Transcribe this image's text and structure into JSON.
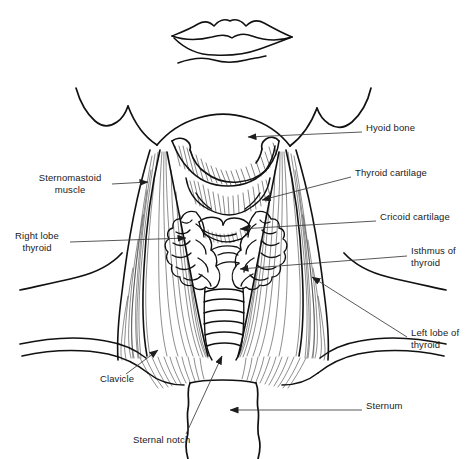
{
  "figure": {
    "type": "anatomical-line-drawing",
    "background_color": "#ffffff",
    "ink_color": "#000000",
    "leader_color": "#3a3a3a",
    "width": 466,
    "height": 459
  },
  "labels": {
    "hyoid_bone": "Hyoid bone",
    "thyroid_cartilage": "Thyroid cartilage",
    "cricoid_cartilage": "Cricoid cartilage",
    "isthmus_of_thyroid": "Isthmus of\nthyroid",
    "left_lobe_of_thyroid": "Left lobe of\nthyroid",
    "sternum": "Sternum",
    "sternomastoid_muscle": "Sternomastoid\nmuscle",
    "right_lobe_thyroid": "Right lobe\nthyroid",
    "clavicle": "Clavicle",
    "sternal_notch": "Sternal notch"
  },
  "label_positions": {
    "hyoid_bone": {
      "x": 366,
      "y": 128,
      "side": "right"
    },
    "thyroid_cartilage": {
      "x": 355,
      "y": 173,
      "side": "right"
    },
    "cricoid_cartilage": {
      "x": 380,
      "y": 217,
      "side": "right"
    },
    "isthmus_of_thyroid": {
      "x": 411,
      "y": 251,
      "side": "right"
    },
    "left_lobe_of_thyroid": {
      "x": 411,
      "y": 333,
      "side": "right"
    },
    "sternum": {
      "x": 366,
      "y": 406,
      "side": "right"
    },
    "sternomastoid_muscle": {
      "x": 34,
      "y": 178,
      "side": "left"
    },
    "right_lobe_thyroid": {
      "x": 10,
      "y": 236,
      "side": "left"
    },
    "clavicle": {
      "x": 100,
      "y": 379,
      "side": "left"
    },
    "sternal_notch": {
      "x": 133,
      "y": 440,
      "side": "center"
    }
  },
  "structures": [
    {
      "name": "lips",
      "note": "Upper and lower lip outline at top of figure"
    },
    {
      "name": "chin-and-jaw",
      "note": "Chin underside with mandible border and ear lobes"
    },
    {
      "name": "hyoid-bone",
      "note": "U-shaped bone below the chin with hatched shading"
    },
    {
      "name": "thyroid-cartilage",
      "note": "Adam's apple prominence, hatched"
    },
    {
      "name": "cricoid-cartilage",
      "note": "Ring cartilage below thyroid cartilage"
    },
    {
      "name": "thyroid-gland",
      "note": "Lobulated bilobed gland with connecting isthmus"
    },
    {
      "name": "trachea",
      "note": "Stack of tracheal cartilage rings below cricoid"
    },
    {
      "name": "sternomastoid-muscle-left",
      "note": "Hatched strap muscle, viewer left"
    },
    {
      "name": "sternomastoid-muscle-right",
      "note": "Hatched strap muscle, viewer right"
    },
    {
      "name": "clavicle-left",
      "note": "Collar bone outline, viewer left"
    },
    {
      "name": "clavicle-right",
      "note": "Collar bone outline, viewer right"
    },
    {
      "name": "sternum",
      "note": "Breastbone below the sternal notch"
    },
    {
      "name": "sternal-notch",
      "note": "Suprasternal hollow at base of neck"
    }
  ]
}
